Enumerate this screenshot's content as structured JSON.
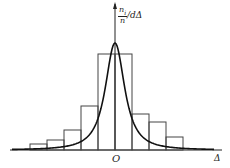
{
  "chart_data": {
    "type": "bar",
    "subtype": "histogram with fitted density curve (error distribution)",
    "title": "",
    "xlabel": "Δ",
    "ylabel": "n_i / n / dΔ",
    "origin_label": "O",
    "bins": [
      {
        "x0": -5,
        "x1": -4,
        "value": 0.06
      },
      {
        "x0": -4,
        "x1": -3,
        "value": 0.1
      },
      {
        "x0": -3,
        "x1": -2,
        "value": 0.2
      },
      {
        "x0": -2,
        "x1": -1,
        "value": 0.44
      },
      {
        "x0": -1,
        "x1": 0,
        "value": 0.96
      },
      {
        "x0": 0,
        "x1": 1,
        "value": 0.96
      },
      {
        "x0": 1,
        "x1": 2,
        "value": 0.36
      },
      {
        "x0": 2,
        "x1": 3,
        "value": 0.28
      },
      {
        "x0": 3,
        "x1": 4,
        "value": 0.13
      }
    ],
    "categories": [
      "-5~-4",
      "-4~-3",
      "-3~-2",
      "-2~-1",
      "-1~0",
      "0~1",
      "1~2",
      "2~3",
      "3~4"
    ],
    "values": [
      0.06,
      0.1,
      0.2,
      0.44,
      0.96,
      0.96,
      0.36,
      0.28,
      0.13
    ],
    "curve": {
      "name": "probability density curve",
      "peak_x": 0,
      "peak_value": 1.07
    },
    "grid": false,
    "legend": "none"
  },
  "labels": {
    "y_num": "n",
    "y_num_sub": "i",
    "y_den": "n",
    "y_tail": "/dΔ",
    "origin": "O",
    "x_axis": "Δ"
  }
}
